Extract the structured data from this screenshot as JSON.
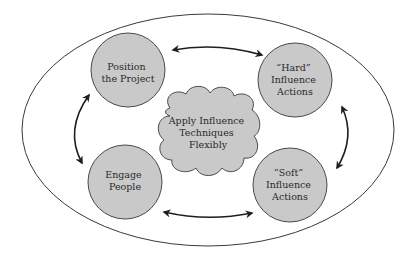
{
  "diagram": {
    "colors": {
      "background": "#ffffff",
      "node_fill": "#c9c9c9",
      "node_stroke": "#4a4a4a",
      "arrow": "#1e1e1e",
      "outer_ellipse": "#3a3a3a"
    },
    "center": {
      "shape": "cloud",
      "lines": [
        "Apply Influence",
        "Techniques",
        "Flexibly"
      ]
    },
    "nodes": [
      {
        "id": "position-project",
        "shape": "circle",
        "lines": [
          "Position",
          "the Project"
        ]
      },
      {
        "id": "hard-influence",
        "shape": "circle",
        "lines": [
          "“Hard”",
          "Influence",
          "Actions"
        ]
      },
      {
        "id": "engage-people",
        "shape": "circle",
        "lines": [
          "Engage",
          "People"
        ]
      },
      {
        "id": "soft-influence",
        "shape": "circle",
        "lines": [
          "“Soft”",
          "Influence",
          "Actions"
        ]
      }
    ],
    "edges": [
      {
        "from": "position-project",
        "to": "hard-influence",
        "type": "bidirectional"
      },
      {
        "from": "hard-influence",
        "to": "soft-influence",
        "type": "bidirectional"
      },
      {
        "from": "soft-influence",
        "to": "engage-people",
        "type": "bidirectional"
      },
      {
        "from": "engage-people",
        "to": "position-project",
        "type": "bidirectional"
      }
    ]
  }
}
